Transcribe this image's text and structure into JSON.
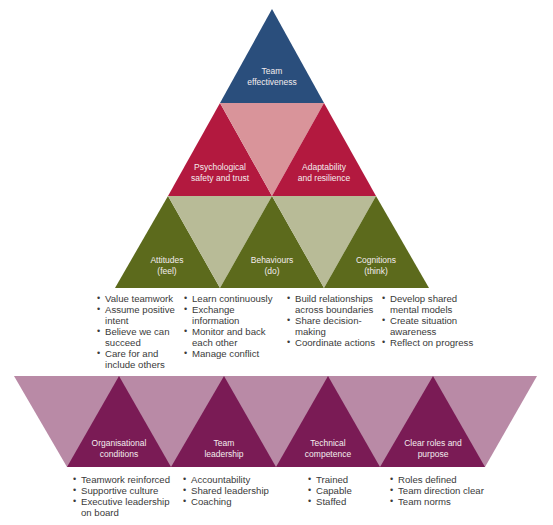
{
  "colors": {
    "top": "#2a4e7c",
    "row2_dark": "#b3193f",
    "row2_light": "#d9949a",
    "row3_dark": "#5c6a1c",
    "row3_light": "#b8bb97",
    "base_dark": "#7a1b55",
    "base_light": "#b98aa6",
    "label_text": "#f3ecee",
    "list_text": "#3a3a3a"
  },
  "top": {
    "label": [
      "Team",
      "effectiveness"
    ]
  },
  "row2": [
    {
      "label": [
        "Psychological",
        "safety and trust"
      ]
    },
    {
      "label": [
        "Adaptability",
        "and resilience"
      ]
    }
  ],
  "row3": [
    {
      "label": [
        "Attitudes",
        "(feel)"
      ],
      "items": [
        "Value teamwork",
        "Assume positive intent",
        "Believe we can succeed",
        "Care for and include others"
      ]
    },
    {
      "label": [
        "Behaviours",
        "(do)"
      ],
      "items": [
        "Learn continuously",
        "Exchange information",
        "Monitor and back each other",
        "Manage conflict"
      ]
    },
    {
      "label": [
        "Cognitions",
        "(think)"
      ],
      "items_left": [
        "Build relationships across boundaries",
        "Share decision-making",
        "Coordinate actions"
      ],
      "items": [
        "Develop shared mental models",
        "Create situation awareness",
        "Reflect on progress"
      ]
    }
  ],
  "base": [
    {
      "label": [
        "Organisational",
        "conditions"
      ],
      "items": [
        "Teamwork reinforced",
        "Supportive culture",
        "Executive leadership on board"
      ]
    },
    {
      "label": [
        "Team",
        "leadership"
      ],
      "items": [
        "Accountability",
        "Shared leadership",
        "Coaching"
      ]
    },
    {
      "label": [
        "Technical",
        "competence"
      ],
      "items": [
        "Trained",
        "Capable",
        "Staffed"
      ]
    },
    {
      "label": [
        "Clear roles and",
        "purpose"
      ],
      "items": [
        "Roles defined",
        "Team direction clear",
        "Team norms"
      ]
    }
  ]
}
